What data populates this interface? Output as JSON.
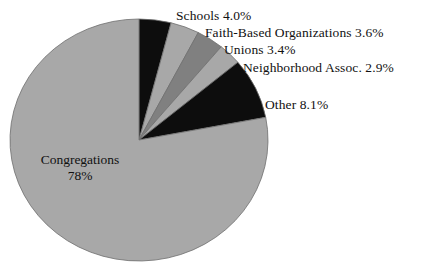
{
  "canvas": {
    "width": 434,
    "height": 274,
    "background": "#ffffff"
  },
  "geometry": {
    "center_x": 139,
    "center_y": 140,
    "radius_x": 129,
    "radius_y": 121,
    "start_angle_deg": 0,
    "direction": "clockwise"
  },
  "chart_data": {
    "type": "pie",
    "title": "",
    "xlabel": "",
    "ylabel": "",
    "legend_position": "none",
    "grid": false,
    "labels_mode": "callout-and-inside",
    "categories": [
      "Schools",
      "Faith-Based Organizations",
      "Unions",
      "Neighborhood Assoc.",
      "Other",
      "Congregations"
    ],
    "values": [
      4.0,
      3.6,
      3.4,
      2.9,
      8.1,
      78
    ],
    "value_labels": [
      "4.0%",
      "3.6%",
      "3.4%",
      "2.9%",
      "8.1%",
      "78%"
    ],
    "colors": [
      "#0d0d0d",
      "#a8a8a8",
      "#808080",
      "#a8a8a8",
      "#0d0d0d",
      "#a8a8a8"
    ],
    "slices": [
      {
        "name": "Schools",
        "value": 4.0,
        "label": "Schools 4.0%",
        "color": "#0d0d0d"
      },
      {
        "name": "Faith-Based Organizations",
        "value": 3.6,
        "label": "Faith-Based Organizations 3.6%",
        "color": "#a8a8a8"
      },
      {
        "name": "Unions",
        "value": 3.4,
        "label": "Unions 3.4%",
        "color": "#808080"
      },
      {
        "name": "Neighborhood Assoc.",
        "value": 2.9,
        "label": "Neighborhood Assoc. 2.9%",
        "color": "#a8a8a8"
      },
      {
        "name": "Other",
        "value": 8.1,
        "label": "Other 8.1%",
        "color": "#0d0d0d"
      },
      {
        "name": "Congregations",
        "value": 78,
        "label": "Congregations 78%",
        "color": "#a8a8a8"
      }
    ]
  },
  "labels": {
    "schools": "Schools 4.0%",
    "faith_based": "Faith-Based Organizations 3.6%",
    "unions": "Unions 3.4%",
    "neighborhood": "Neighborhood Assoc. 2.9%",
    "other": "Other 8.1%",
    "congregations_name": "Congregations",
    "congregations_value": "78%"
  },
  "colors": {
    "slice_light": "#a8a8a8",
    "slice_medium": "#808080",
    "slice_dark": "#0d0d0d",
    "outline": "#6f6f6f",
    "text": "#111111",
    "background": "#ffffff"
  }
}
